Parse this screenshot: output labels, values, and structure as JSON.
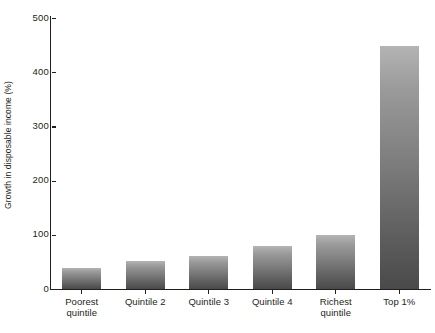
{
  "chart_data": {
    "type": "bar",
    "title": "",
    "subtitle": "",
    "xlabel": "",
    "ylabel": "Growth in disposable income (%)",
    "categories": [
      "Poorest\nquintile",
      "Quintile 2",
      "Quintile 3",
      "Quintile 4",
      "Richest\nquintile",
      "Top 1%"
    ],
    "values": [
      38,
      52,
      60,
      79,
      100,
      448
    ],
    "ylim": [
      0,
      500
    ],
    "yticks": [
      0,
      100,
      200,
      300,
      400,
      500
    ],
    "ytick_labels": [
      "0",
      "100",
      "200",
      "300",
      "400",
      "500"
    ],
    "grid": false,
    "legend": null,
    "legend_position": "none",
    "series": [
      {
        "name": "Growth in disposable income (%)",
        "values": [
          38,
          52,
          60,
          79,
          100,
          448
        ]
      }
    ],
    "bar_fill_top_color": "#b4b4b4",
    "bar_fill_bottom_color": "#4a4a4a",
    "axis_color": "#231f20",
    "background_color": "#ffffff"
  },
  "caption": {
    "text": ""
  }
}
